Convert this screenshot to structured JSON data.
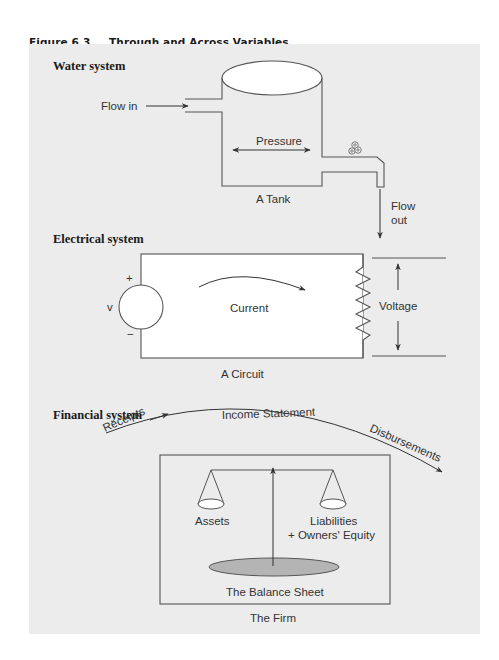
{
  "figure": {
    "number": "Figure 6.3",
    "title": "Through and Across Variables"
  },
  "water_system": {
    "heading": "Water system",
    "flow_in": "Flow in",
    "pressure": "Pressure",
    "tank_caption": "A Tank",
    "flow_out_line1": "Flow",
    "flow_out_line2": "out"
  },
  "electrical_system": {
    "heading": "Electrical system",
    "source_label": "v",
    "plus": "+",
    "minus": "−",
    "current": "Current",
    "voltage": "Voltage",
    "circuit_caption": "A Circuit"
  },
  "financial_system": {
    "heading": "Financial system",
    "receipts": "Receipts",
    "income_statement": "Income Statement",
    "disbursements": "Disbursements",
    "assets": "Assets",
    "liabilities_line1": "Liabilities",
    "liabilities_line2": "+ Owners' Equity",
    "balance_sheet": "The Balance Sheet",
    "firm_caption": "The Firm"
  },
  "colors": {
    "panel_background": "#ececec",
    "line": "#555555",
    "fill_white": "#ffffff",
    "balance_sheet_fill": "#b4b4b4"
  }
}
